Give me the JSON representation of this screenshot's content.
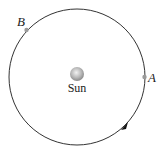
{
  "diagram": {
    "sun": {
      "label": "Sun",
      "cx": 77,
      "cy": 74,
      "r": 7
    },
    "orbit": {
      "cx": 77,
      "cy": 77,
      "r": 68,
      "direction": "counterclockwise"
    },
    "points": [
      {
        "id": "A",
        "label": "A",
        "x": 144.5,
        "y": 77
      },
      {
        "id": "B",
        "label": "B",
        "x": 26.5,
        "y": 30
      }
    ],
    "colors": {
      "orbit": "#333333",
      "point": "#9a9a9a",
      "sun_light": "#e6e6e6",
      "sun_dark": "#8a8a8a"
    }
  }
}
